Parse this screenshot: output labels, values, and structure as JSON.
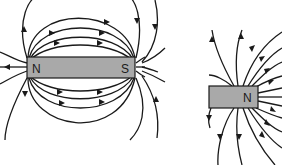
{
  "diagram": {
    "type": "magnetic field lines",
    "magnets": [
      {
        "id": "bar-magnet",
        "poles": [
          {
            "label": "N"
          },
          {
            "label": "S"
          }
        ],
        "color": "#a9a9a9"
      },
      {
        "id": "single-pole-magnet",
        "poles": [
          {
            "label": "N"
          }
        ],
        "color": "#a9a9a9"
      }
    ],
    "line_color": "#1a1a1a"
  }
}
